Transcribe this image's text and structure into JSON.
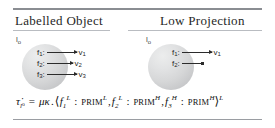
{
  "figure": {
    "columns": [
      {
        "title": "Labelled Object",
        "object_label": "l",
        "object_label_sub": "o",
        "rows": [
          {
            "field": "f",
            "field_sub": "1",
            "sep": ":",
            "arrow": "long-arrow-icon",
            "value": "v",
            "value_sub": "1"
          },
          {
            "field": "f",
            "field_sub": "2",
            "sep": ":",
            "arrow": "mid-arrow-icon",
            "value": "v",
            "value_sub": "2"
          },
          {
            "field": "f",
            "field_sub": "3",
            "sep": ":",
            "arrow": "long-arrow-icon",
            "value": "v",
            "value_sub": "3"
          }
        ]
      },
      {
        "title": "Low Projection",
        "object_label": "l",
        "object_label_sub": "o",
        "rows": [
          {
            "field": "f",
            "field_sub": "1",
            "sep": ":",
            "arrow": "long-arrow-icon",
            "value": "v",
            "value_sub": "1"
          },
          {
            "field": "f",
            "field_sub": "2",
            "sep": ":",
            "arrow": "blunt-arrow-icon",
            "value": "",
            "value_sub": ""
          }
        ]
      }
    ],
    "formula": {
      "tau": "τ",
      "tau_sub": "l",
      "tau_subsub": "o",
      "equals": "=",
      "mu": "μ",
      "kappa": "κ",
      "dot": ".",
      "open_angle": "⟨",
      "close_angle": "⟩",
      "comma": ",",
      "colon": ":",
      "terms": [
        {
          "field": "f",
          "field_sub": "1",
          "field_sup": "L",
          "prim": "PRIM",
          "prim_sup": "L"
        },
        {
          "field": "f",
          "field_sub": "2",
          "field_sup": "L",
          "prim": "PRIM",
          "prim_sup": "H"
        },
        {
          "field": "f",
          "field_sub": "3",
          "field_sup": "H",
          "prim": "PRIM",
          "prim_sup": "H"
        }
      ],
      "result_sup": "L"
    },
    "colors": {
      "rule_strong": "#8a8d92",
      "rule_light": "#b9bcc1",
      "blob_light": "#eceded",
      "blob_dark": "#bcbdbf",
      "ink": "#1c1c1c"
    }
  }
}
